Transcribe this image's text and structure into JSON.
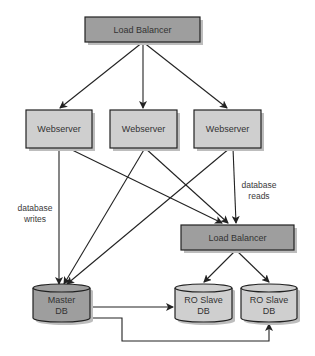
{
  "diagram": {
    "title": "",
    "colors": {
      "load_balancer_fill": "#9e9e9e",
      "webserver_fill": "#cfcfcf",
      "master_db_fill": "#9e9e9e",
      "slave_db_fill": "#cfcfcf",
      "stroke": "#222222",
      "shadow": "#bdbdbd",
      "line": "#222222"
    },
    "nodes": [
      {
        "id": "lb-top",
        "type": "box",
        "label": "Load Balancer",
        "x": 85,
        "y": 17,
        "w": 115,
        "h": 25,
        "fill": "load_balancer_fill"
      },
      {
        "id": "web-1",
        "type": "box",
        "label": "Webserver",
        "x": 26,
        "y": 110,
        "w": 66,
        "h": 38,
        "fill": "webserver_fill"
      },
      {
        "id": "web-2",
        "type": "box",
        "label": "Webserver",
        "x": 110,
        "y": 110,
        "w": 67,
        "h": 38,
        "fill": "webserver_fill"
      },
      {
        "id": "web-3",
        "type": "box",
        "label": "Webserver",
        "x": 194,
        "y": 110,
        "w": 67,
        "h": 38,
        "fill": "webserver_fill"
      },
      {
        "id": "lb-db",
        "type": "box",
        "label": "Load Balancer",
        "x": 181,
        "y": 225,
        "w": 113,
        "h": 25,
        "fill": "load_balancer_fill"
      },
      {
        "id": "master-db",
        "type": "cylinder",
        "label": "Master\nDB",
        "x": 33,
        "y": 284,
        "w": 57,
        "h": 38,
        "fill": "master_db_fill"
      },
      {
        "id": "slave-db-1",
        "type": "cylinder",
        "label": "RO Slave\nDB",
        "x": 175,
        "y": 284,
        "w": 57,
        "h": 38,
        "fill": "slave_db_fill"
      },
      {
        "id": "slave-db-2",
        "type": "cylinder",
        "label": "RO Slave\nDB",
        "x": 241,
        "y": 284,
        "w": 56,
        "h": 38,
        "fill": "slave_db_fill"
      }
    ],
    "edges": [
      {
        "from": "lb-top",
        "to": "web-1",
        "points": [
          [
            143,
            42
          ],
          [
            60,
            108
          ]
        ]
      },
      {
        "from": "lb-top",
        "to": "web-2",
        "points": [
          [
            143,
            42
          ],
          [
            143,
            108
          ]
        ]
      },
      {
        "from": "lb-top",
        "to": "web-3",
        "points": [
          [
            143,
            42
          ],
          [
            227,
            108
          ]
        ]
      },
      {
        "from": "web-1",
        "to": "master-db",
        "points": [
          [
            59,
            148
          ],
          [
            59,
            284
          ]
        ]
      },
      {
        "from": "web-1",
        "to": "lb-db",
        "points": [
          [
            68,
            148
          ],
          [
            222,
            223
          ]
        ]
      },
      {
        "from": "web-2",
        "to": "master-db",
        "points": [
          [
            145,
            148
          ],
          [
            64,
            284
          ]
        ]
      },
      {
        "from": "web-2",
        "to": "lb-db",
        "points": [
          [
            145,
            148
          ],
          [
            228,
            223
          ]
        ]
      },
      {
        "from": "web-3",
        "to": "master-db",
        "points": [
          [
            230,
            148
          ],
          [
            67,
            284
          ]
        ]
      },
      {
        "from": "web-3",
        "to": "lb-db",
        "points": [
          [
            233,
            148
          ],
          [
            236,
            223
          ]
        ]
      },
      {
        "from": "lb-db",
        "to": "slave-db-1",
        "points": [
          [
            236,
            250
          ],
          [
            204,
            282
          ]
        ]
      },
      {
        "from": "lb-db",
        "to": "slave-db-2",
        "points": [
          [
            236,
            250
          ],
          [
            269,
            282
          ]
        ]
      },
      {
        "from": "master-db",
        "to": "slave-db-1",
        "points": [
          [
            91,
            307
          ],
          [
            173,
            307
          ]
        ]
      },
      {
        "from": "master-db",
        "to": "slave-db-2",
        "points": [
          [
            91,
            318
          ],
          [
            122,
            318
          ],
          [
            122,
            341
          ],
          [
            269,
            341
          ],
          [
            269,
            324
          ]
        ]
      }
    ],
    "annotations": [
      {
        "id": "writes-label",
        "text": "database\nwrites",
        "x": 14,
        "y": 203,
        "w": 42
      },
      {
        "id": "reads-label",
        "text": "database\nreads",
        "x": 238,
        "y": 180,
        "w": 42
      }
    ]
  }
}
